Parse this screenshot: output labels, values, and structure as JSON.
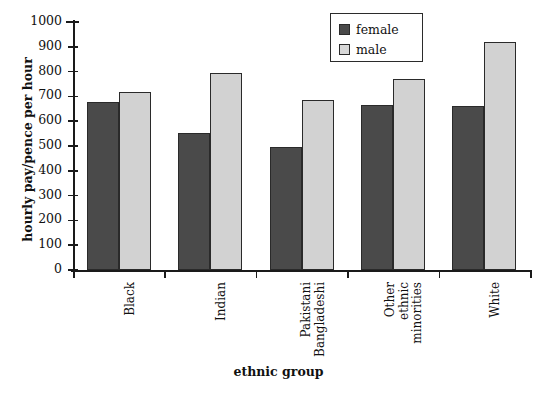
{
  "chart_data": {
    "type": "bar",
    "title": "",
    "xlabel": "ethnic group",
    "ylabel": "hourly pay/pence per hour",
    "ylim": [
      0,
      1000
    ],
    "ytick_step": 100,
    "ytick_labels": [
      "1000",
      "900",
      "800",
      "700",
      "600",
      "500",
      "400",
      "300",
      "200",
      "100",
      "0"
    ],
    "grid": false,
    "legend_position": "top-center-right",
    "categories": [
      "Black",
      "Indian",
      "Pakistani\nBangladeshi",
      "Other\nethnic\nminorities",
      "White"
    ],
    "series": [
      {
        "name": "female",
        "color": "#4a4a4a",
        "values": [
          677,
          551,
          495,
          665,
          663
        ]
      },
      {
        "name": "male",
        "color": "#d2d2d2",
        "values": [
          718,
          795,
          685,
          770,
          920
        ]
      }
    ]
  },
  "legend": {
    "items": [
      {
        "label": "female",
        "swatch": "female-swatch"
      },
      {
        "label": "male",
        "swatch": "male-swatch"
      }
    ]
  },
  "colors": {
    "female_bar": "#4a4a4a",
    "male_bar": "#d2d2d2",
    "axis": "#1a1a1a",
    "background": "#ffffff"
  }
}
